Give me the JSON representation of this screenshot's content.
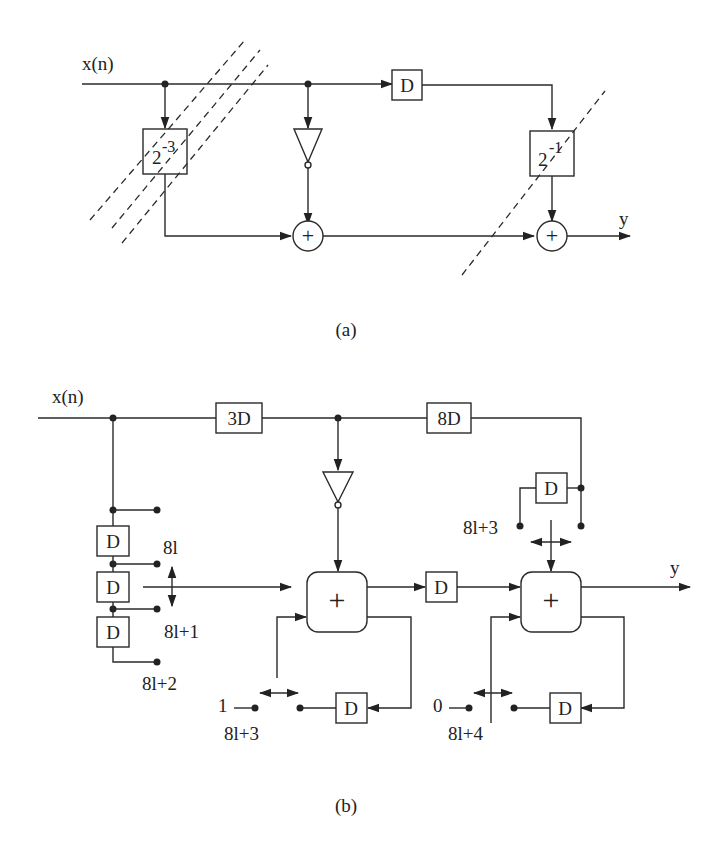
{
  "diagram_a": {
    "caption": "(a)",
    "input_label": "x(n)",
    "output_label": "y",
    "shift_box_1": {
      "base": "2",
      "exp": "-3"
    },
    "shift_box_2": {
      "base": "2",
      "exp": "-1"
    },
    "delay_label": "D",
    "adder_symbol": "+"
  },
  "diagram_b": {
    "caption": "(b)",
    "input_label": "x(n)",
    "output_label": "y",
    "delay_3d": "3D",
    "delay_8d": "8D",
    "delay_label": "D",
    "adder_symbol": "+",
    "tap_labels": {
      "t0": "8l",
      "t1": "8l+1",
      "t2": "8l+2",
      "t3_right": "8l+3",
      "acc1_switch": "8l+3",
      "acc2_switch": "8l+4"
    },
    "acc1_const": "1",
    "acc2_const": "0"
  }
}
